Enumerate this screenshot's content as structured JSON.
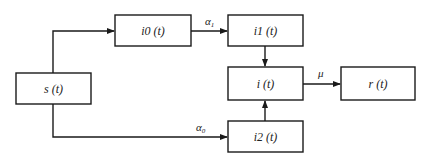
{
  "diagram": {
    "type": "compartmental-flow",
    "nodes": [
      {
        "id": "s",
        "label": "s (t)"
      },
      {
        "id": "i0",
        "label": "i0 (t)"
      },
      {
        "id": "i1",
        "label": "i1 (t)"
      },
      {
        "id": "i",
        "label": "i (t)"
      },
      {
        "id": "r",
        "label": "r (t)"
      },
      {
        "id": "i2",
        "label": "i2 (t)"
      }
    ],
    "edges": [
      {
        "from": "s",
        "to": "i0",
        "label": ""
      },
      {
        "from": "i0",
        "to": "i1",
        "label_main": "α",
        "label_sub": "1"
      },
      {
        "from": "i1",
        "to": "i",
        "label": ""
      },
      {
        "from": "i",
        "to": "r",
        "label_main": "μ",
        "label_sub": ""
      },
      {
        "from": "s",
        "to": "i2",
        "label_main": "α",
        "label_sub": "0"
      },
      {
        "from": "i2",
        "to": "i",
        "label": ""
      }
    ]
  }
}
